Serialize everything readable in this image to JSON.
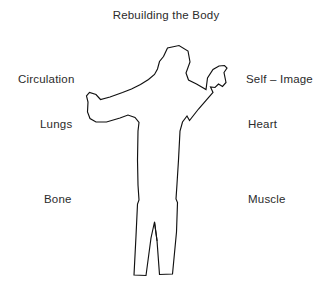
{
  "diagram": {
    "title": "Rebuilding the Body",
    "background_color": "#ffffff",
    "line_color": "#111111",
    "text_color": "#2b2b2b",
    "figure": {
      "name": "human-body-outline",
      "description": "Line-drawn outline of a standing human figure, left arm extended outward to the side, right arm raised upward with open hand"
    },
    "labels": {
      "left": [
        {
          "text": "Circulation",
          "x": 18,
          "y": 72
        },
        {
          "text": "Lungs",
          "x": 40,
          "y": 117
        },
        {
          "text": "Bone",
          "x": 44,
          "y": 192
        }
      ],
      "right": [
        {
          "text": "Self – Image",
          "x": 246,
          "y": 72
        },
        {
          "text": "Heart",
          "x": 248,
          "y": 117
        },
        {
          "text": "Muscle",
          "x": 248,
          "y": 192
        }
      ]
    }
  }
}
